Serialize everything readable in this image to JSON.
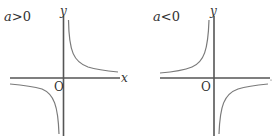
{
  "panels": [
    {
      "condition": "a>0",
      "condition_var": "a",
      "condition_op": ">",
      "condition_val": "0",
      "x_label": "x",
      "y_label": "y",
      "origin_label": "O",
      "curve": "hyperbola in quadrants I and III"
    },
    {
      "condition": "a<0",
      "condition_var": "a",
      "condition_op": "<",
      "condition_val": "0",
      "x_label": "",
      "y_label": "y",
      "origin_label": "O",
      "curve": "hyperbola in quadrants II and IV"
    }
  ],
  "colors": {
    "axis": "#555555",
    "curve": "#7a7a7a",
    "text": "#333333"
  }
}
